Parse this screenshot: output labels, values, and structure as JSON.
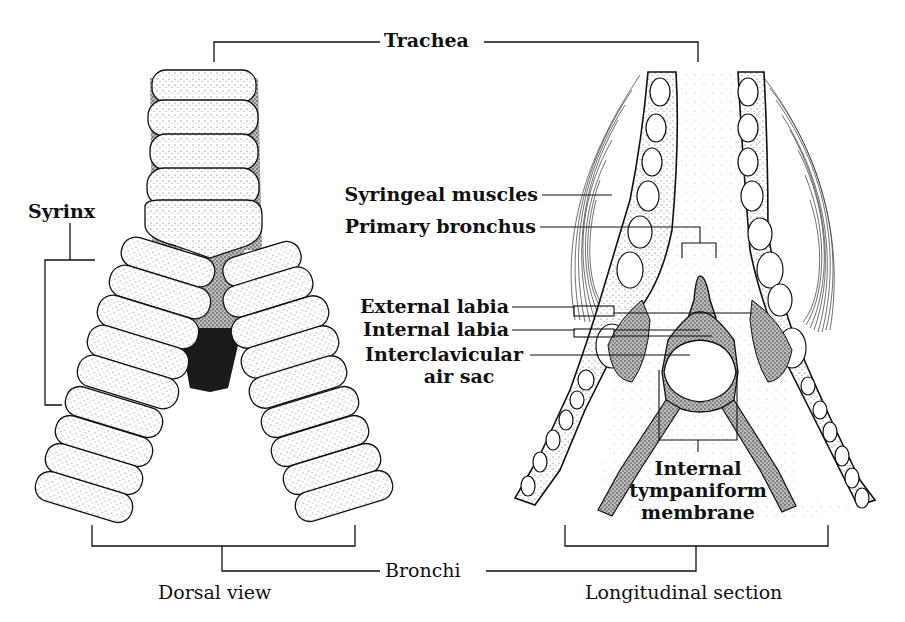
{
  "figure": {
    "panels": [
      {
        "id": "left",
        "caption": "Dorsal view"
      },
      {
        "id": "right",
        "caption": "Longitudinal section"
      }
    ]
  },
  "labels": {
    "trachea": "Trachea",
    "syrinx": "Syrinx",
    "bronchi": "Bronchi",
    "syringeal_muscles": "Syringeal muscles",
    "primary_bronchus": "Primary bronchus",
    "external_labia": "External labia",
    "internal_labia": "Internal labia",
    "interclavicular_line1": "Interclavicular",
    "interclavicular_line2": "air sac",
    "itm_line1": "Internal",
    "itm_line2": "tympaniform",
    "itm_line3": "membrane",
    "caption_left": "Dorsal view",
    "caption_right": "Longitudinal section"
  },
  "colors": {
    "ink": "#111111",
    "background": "#ffffff",
    "stipple": "#6a6a6a"
  }
}
